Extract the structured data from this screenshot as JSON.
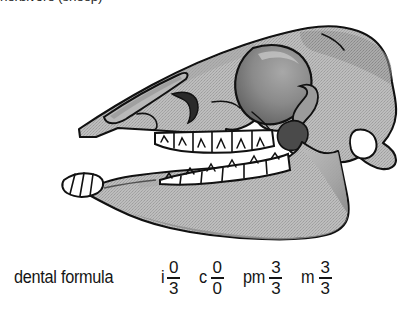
{
  "figure": {
    "caption_top": "herbivore (sheep)",
    "alt": "Grayscale lateral-view line drawing of a herbivore (sheep) skull with the mandible, showing a long diastema, selenodont cheek teeth, lower incisors and no upper incisors or canines."
  },
  "dental_formula": {
    "label": "dental formula",
    "terms": [
      {
        "name": "incisors",
        "abbr": "i",
        "upper": "0",
        "lower": "3"
      },
      {
        "name": "canines",
        "abbr": "c",
        "upper": "0",
        "lower": "0"
      },
      {
        "name": "premolars",
        "abbr": "pm",
        "upper": "3",
        "lower": "3"
      },
      {
        "name": "molars",
        "abbr": "m",
        "upper": "3",
        "lower": "3"
      }
    ]
  },
  "colors": {
    "background": "#ffffff",
    "ink": "#151515",
    "outline": "#111111",
    "bone_fill": "#b3b3b3",
    "bone_shade": "#8d8d8d",
    "bone_deep_shade": "#6f6f6f",
    "tooth_fill": "#ffffff"
  }
}
